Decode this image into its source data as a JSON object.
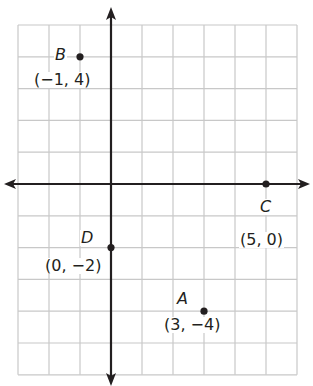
{
  "chart_data": {
    "type": "scatter",
    "title": "",
    "xlabel": "",
    "ylabel": "",
    "xlim": [
      -3,
      6
    ],
    "ylim": [
      -6,
      5
    ],
    "grid": true,
    "grid_step": 1,
    "tick_labels": false,
    "axes_arrows": true,
    "points": [
      {
        "name": "B",
        "x": -1,
        "y": 4,
        "coord_label": "(−1, 4)"
      },
      {
        "name": "C",
        "x": 5,
        "y": 0,
        "coord_label": "(5, 0)"
      },
      {
        "name": "D",
        "x": 0,
        "y": -2,
        "coord_label": "(0, −2)"
      },
      {
        "name": "A",
        "x": 3,
        "y": -4,
        "coord_label": "(3, −4)"
      }
    ]
  },
  "colors": {
    "grid": "#c8c8c8",
    "axes": "#231f20",
    "points": "#231f20",
    "background": "#ffffff"
  },
  "labels": {
    "B": {
      "name": "B",
      "coords": "(−1, 4)"
    },
    "C": {
      "name": "C",
      "coords": "(5, 0)"
    },
    "D": {
      "name": "D",
      "coords": "(0, −2)"
    },
    "A": {
      "name": "A",
      "coords": "(3, −4)"
    }
  }
}
